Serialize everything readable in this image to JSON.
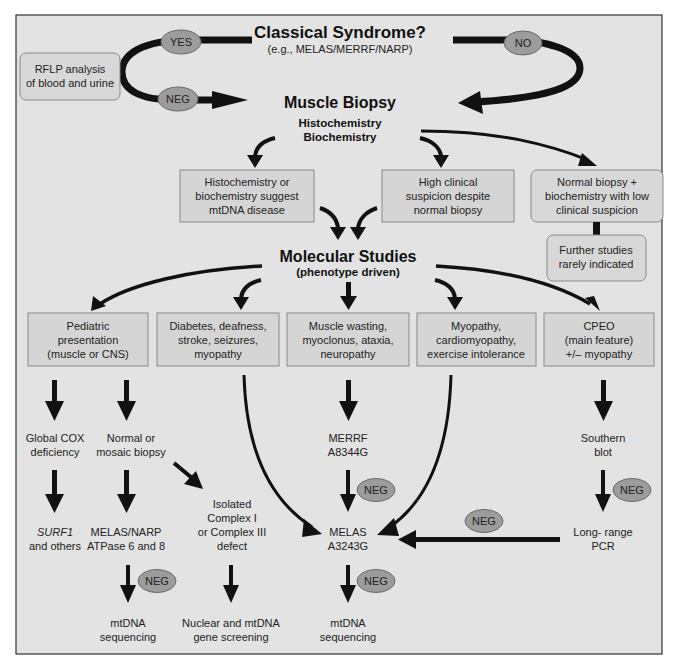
{
  "diagram": {
    "title": "Classical Syndrome?",
    "subtitle": "(e.g., MELAS/MERRF/NARP)",
    "rflp_box": [
      "RFLP analysis",
      "of blood and urine"
    ],
    "labels": {
      "yes": "YES",
      "no": "NO",
      "neg": "NEG"
    },
    "muscle_biopsy": {
      "title": "Muscle Biopsy",
      "sub1": "Histochemistry",
      "sub2": "Biochemistry"
    },
    "biopsy_outcomes": [
      {
        "lines": [
          "Histochemistry or",
          "biochemistry suggest",
          "mtDNA disease"
        ]
      },
      {
        "lines": [
          "High clinical",
          "suspicion despite",
          "normal biopsy"
        ]
      },
      {
        "lines": [
          "Normal biopsy +",
          "biochemistry with low",
          "clinical suspicion"
        ]
      }
    ],
    "further_studies": [
      "Further studies",
      "rarely indicated"
    ],
    "molecular_studies": {
      "title": "Molecular Studies",
      "sub": "(phenotype driven)"
    },
    "phenotypes": [
      {
        "lines": [
          "Pediatric",
          "presentation",
          "(muscle or CNS)"
        ]
      },
      {
        "lines": [
          "Diabetes, deafness,",
          "stroke, seizures,",
          "myopathy"
        ]
      },
      {
        "lines": [
          "Muscle wasting,",
          "myoclonus, ataxia,",
          "neuropathy"
        ]
      },
      {
        "lines": [
          "Myopathy,",
          "cardiomyopathy,",
          "exercise intolerance"
        ]
      },
      {
        "lines": [
          "CPEO",
          "(main feature)",
          "+/– myopathy"
        ]
      }
    ],
    "nodes": {
      "global_cox": [
        "Global COX",
        "deficiency"
      ],
      "normal_mosaic": [
        "Normal or",
        "mosaic biopsy"
      ],
      "merrf": [
        "MERRF",
        "A8344G"
      ],
      "southern": [
        "Southern",
        "blot"
      ],
      "surf1": [
        "SURF1",
        "and others"
      ],
      "melas_narp": [
        "MELAS/NARP",
        "ATPase 6 and 8"
      ],
      "isolated_complex": [
        "Isolated",
        "Complex I",
        "or Complex III",
        "defect"
      ],
      "melas": [
        "MELAS",
        "A3243G"
      ],
      "long_range": [
        "Long- range",
        "PCR"
      ],
      "mtdna_seq_left": [
        "mtDNA",
        "sequencing"
      ],
      "nuclear_screening": [
        "Nuclear and mtDNA",
        "gene screening"
      ],
      "mtdna_seq_center": [
        "mtDNA",
        "sequencing"
      ]
    },
    "colors": {
      "background": "#e3e3e3",
      "box_fill": "#d5d5d5",
      "box_border": "#8a8a8a",
      "ellipse_fill": "#9c9c9c",
      "arrow": "#111111"
    }
  }
}
